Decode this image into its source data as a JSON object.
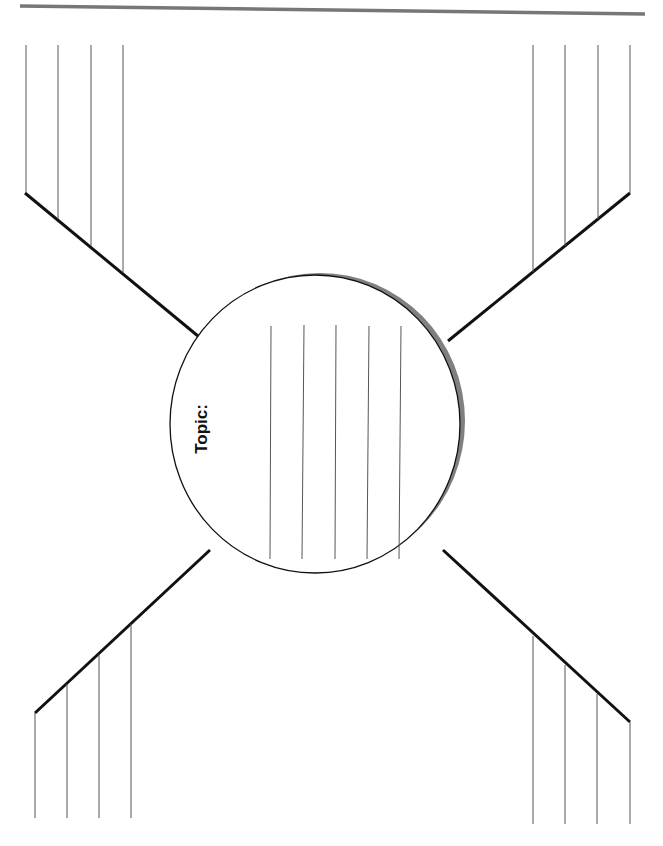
{
  "worksheet": {
    "type": "spider-map graphic organizer",
    "center": {
      "label": "Topic:",
      "writing_lines": 5
    },
    "branches": [
      {
        "position": "top-left",
        "writing_lines": 4
      },
      {
        "position": "top-right",
        "writing_lines": 4
      },
      {
        "position": "bottom-left",
        "writing_lines": 4
      },
      {
        "position": "bottom-right",
        "writing_lines": 4
      }
    ]
  },
  "colors": {
    "line": "#111111",
    "writing_line": "#555555",
    "header_rule": "#777777",
    "circle_shadow": "#808080",
    "background": "#ffffff"
  }
}
